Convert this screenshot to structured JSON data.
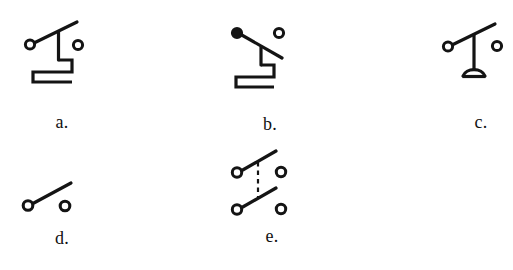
{
  "page": {
    "background_color": "#ffffff",
    "ink_color": "#141414"
  },
  "figures": [
    {
      "id": "a",
      "label": "a.",
      "caption": "a.",
      "symbol_name": "knife-switch-closed-with-stepped-contact",
      "description": "Knife switch: left open terminal, blade angled up to the right, vertical stem descending to a stepped rectangular contact arm, right open terminal",
      "terminal_count": 2,
      "left_terminal_style": "open-circle",
      "right_terminal_style": "open-circle",
      "blade_direction": "up-right",
      "has_stepped_contact": true,
      "has_dome_base": false,
      "has_dashed_link": false
    },
    {
      "id": "b",
      "label": "b.",
      "caption": "b.",
      "symbol_name": "knife-switch-open-with-stepped-contact",
      "description": "Knife switch variant: left filled terminal, blade angled down to the right, vertical stem descending to a stepped rectangular contact arm, right open terminal",
      "terminal_count": 2,
      "left_terminal_style": "filled-circle",
      "right_terminal_style": "open-circle",
      "blade_direction": "down-right",
      "has_stepped_contact": true,
      "has_dome_base": false,
      "has_dashed_link": false
    },
    {
      "id": "c",
      "label": "c.",
      "caption": "c.",
      "symbol_name": "switch-with-dome-base",
      "description": "Switch: left open terminal, blade angled up to the right, vertical stem descending to a semicircular dome base, right open terminal",
      "terminal_count": 2,
      "left_terminal_style": "open-circle",
      "right_terminal_style": "open-circle",
      "blade_direction": "up-right",
      "has_stepped_contact": false,
      "has_dome_base": true,
      "has_dashed_link": false
    },
    {
      "id": "d",
      "label": "d.",
      "caption": "d.",
      "symbol_name": "simple-open-switch",
      "description": "Simple single-pole switch shown open: left open terminal with blade angled up to the right, separate right open terminal",
      "terminal_count": 2,
      "left_terminal_style": "open-circle",
      "right_terminal_style": "open-circle",
      "blade_direction": "up-right",
      "has_stepped_contact": false,
      "has_dome_base": false,
      "has_dashed_link": false
    },
    {
      "id": "e",
      "label": "e.",
      "caption": "e.",
      "symbol_name": "ganged-double-pole-switch",
      "description": "Two-pole ganged switch: two open switches stacked vertically, each with an open terminal and blade angled up to the right, linked by a vertical dashed mechanical-coupling line",
      "terminal_count": 4,
      "left_terminal_style": "open-circle",
      "right_terminal_style": "open-circle",
      "blade_direction": "up-right",
      "has_stepped_contact": false,
      "has_dome_base": false,
      "has_dashed_link": true,
      "pole_count": 2
    }
  ]
}
